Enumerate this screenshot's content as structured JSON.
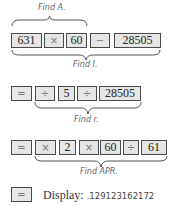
{
  "steps": {
    "find_a": {
      "label": "Find A."
    },
    "find_i": {
      "label": "Find I."
    },
    "find_r": {
      "label": "Find r."
    },
    "find_apr": {
      "label": "Find APR."
    }
  },
  "row1": {
    "keys": [
      "631",
      "×",
      "60",
      "−",
      "28505"
    ]
  },
  "row2": {
    "keys": [
      "=",
      "÷",
      "5",
      "÷",
      "28505"
    ]
  },
  "row3": {
    "keys": [
      "=",
      "×",
      "2",
      "×",
      "60",
      "÷",
      "61"
    ]
  },
  "row4": {
    "keys": [
      "="
    ],
    "display_label": "Display:",
    "display_value": ".129123162172"
  },
  "colors": {
    "key_fill": "#e6e6e6",
    "key_border": "#4a4a4a",
    "label_text": "#666666"
  }
}
